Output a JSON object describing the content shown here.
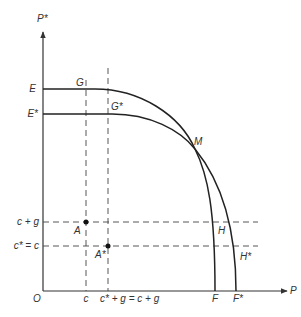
{
  "diagram": {
    "axes": {
      "x_label": "P",
      "y_label": "P*",
      "origin_label": "O"
    },
    "y_labels": {
      "E": "E",
      "E_star": "E*",
      "c_plus_g": "c + g",
      "c_star_eq_c": "c* = c"
    },
    "x_labels": {
      "c": "c",
      "c_star_plus_g": "c* + g = c + g",
      "F": "F",
      "F_star": "F*"
    },
    "points": {
      "G": "G",
      "G_star": "G*",
      "M": "M",
      "A": "A",
      "A_star": "A*",
      "H": "H",
      "H_star": "H*"
    },
    "curves": [
      {
        "name": "E-G-M-H-F frontier",
        "from": "E",
        "to": "F"
      },
      {
        "name": "E*-G*-M-H*-F* frontier",
        "from": "E*",
        "to": "F*"
      }
    ]
  }
}
